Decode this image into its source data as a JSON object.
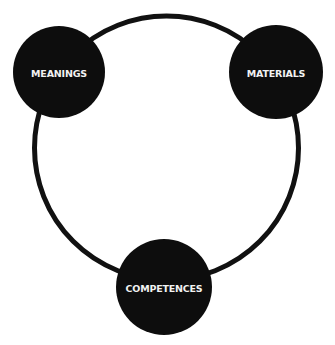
{
  "diagram": {
    "type": "cycle",
    "colors": {
      "background": "#ffffff",
      "ring": "#111111",
      "node_fill": "#0d0d0d",
      "label": "#f2f2f2"
    },
    "ring": {
      "cx": 166.5,
      "cy": 148,
      "r": 132,
      "stroke_width": 5
    },
    "nodes": [
      {
        "id": "meanings",
        "label": "MEANINGS",
        "cx": 59,
        "cy": 72,
        "r": 46
      },
      {
        "id": "materials",
        "label": "MATERIALS",
        "cx": 276,
        "cy": 72,
        "r": 47
      },
      {
        "id": "competences",
        "label": "COMPETENCES",
        "cx": 164,
        "cy": 287,
        "r": 48
      }
    ]
  }
}
